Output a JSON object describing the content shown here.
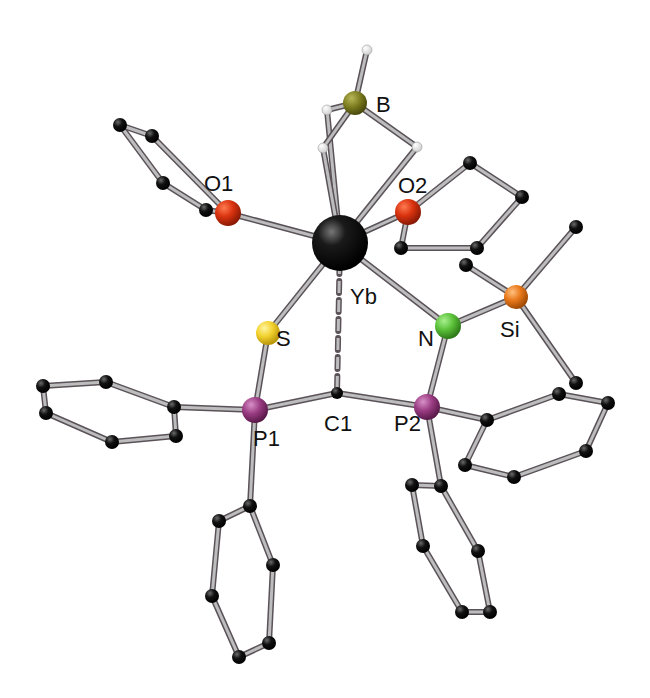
{
  "colors": {
    "background": "#ffffff",
    "bond_light": "#bdbdbd",
    "bond_dark": "#5a5258",
    "carbon": "#0d0d0d",
    "hydrogen": "#f2f2f2",
    "Yb": "#111111",
    "B": "#7a7a1e",
    "O": "#d9330f",
    "S": "#f2d12e",
    "N": "#5cc23a",
    "Si": "#e8781a",
    "P": "#9a3c82"
  },
  "labels": {
    "B": "B",
    "O1": "O1",
    "O2": "O2",
    "Yb": "Yb",
    "S": "S",
    "N": "N",
    "Si": "Si",
    "P1": "P1",
    "C1": "C1",
    "P2": "P2"
  },
  "atoms": [
    {
      "id": "Yb",
      "el": "Yb",
      "x": 340,
      "y": 243,
      "r": 28
    },
    {
      "id": "B",
      "el": "B",
      "x": 355,
      "y": 103,
      "r": 12
    },
    {
      "id": "H1",
      "el": "H",
      "x": 367,
      "y": 50,
      "r": 5
    },
    {
      "id": "H2",
      "el": "H",
      "x": 327,
      "y": 110,
      "r": 5
    },
    {
      "id": "H3",
      "el": "H",
      "x": 323,
      "y": 148,
      "r": 5
    },
    {
      "id": "H4",
      "el": "H",
      "x": 417,
      "y": 147,
      "r": 5
    },
    {
      "id": "O1",
      "el": "O",
      "x": 228,
      "y": 213,
      "r": 13
    },
    {
      "id": "O1C1",
      "el": "C",
      "x": 206,
      "y": 210,
      "r": 7
    },
    {
      "id": "O1C2",
      "el": "C",
      "x": 163,
      "y": 183,
      "r": 7
    },
    {
      "id": "O1C3",
      "el": "C",
      "x": 120,
      "y": 125,
      "r": 7
    },
    {
      "id": "O1C4",
      "el": "C",
      "x": 152,
      "y": 136,
      "r": 7
    },
    {
      "id": "O2",
      "el": "O",
      "x": 408,
      "y": 212,
      "r": 13
    },
    {
      "id": "O2C1",
      "el": "C",
      "x": 401,
      "y": 248,
      "r": 7
    },
    {
      "id": "O2C2",
      "el": "C",
      "x": 477,
      "y": 248,
      "r": 7
    },
    {
      "id": "O2C3",
      "el": "C",
      "x": 522,
      "y": 197,
      "r": 7
    },
    {
      "id": "O2C4",
      "el": "C",
      "x": 470,
      "y": 163,
      "r": 7
    },
    {
      "id": "S",
      "el": "S",
      "x": 268,
      "y": 333,
      "r": 12
    },
    {
      "id": "N",
      "el": "N",
      "x": 448,
      "y": 326,
      "r": 13
    },
    {
      "id": "Si",
      "el": "Si",
      "x": 516,
      "y": 297,
      "r": 12
    },
    {
      "id": "SiMe1",
      "el": "C",
      "x": 576,
      "y": 227,
      "r": 7
    },
    {
      "id": "SiMe2",
      "el": "C",
      "x": 466,
      "y": 265,
      "r": 7
    },
    {
      "id": "SiMe3",
      "el": "C",
      "x": 576,
      "y": 383,
      "r": 7
    },
    {
      "id": "P1",
      "el": "P",
      "x": 255,
      "y": 410,
      "r": 13
    },
    {
      "id": "C1",
      "el": "C",
      "x": 337,
      "y": 393,
      "r": 6
    },
    {
      "id": "P2",
      "el": "P",
      "x": 427,
      "y": 407,
      "r": 13
    },
    {
      "id": "Ph1a",
      "el": "C",
      "x": 174,
      "y": 407,
      "r": 7
    },
    {
      "id": "Ph1b",
      "el": "C",
      "x": 106,
      "y": 382,
      "r": 7
    },
    {
      "id": "Ph1c",
      "el": "C",
      "x": 43,
      "y": 386,
      "r": 7
    },
    {
      "id": "Ph1d",
      "el": "C",
      "x": 46,
      "y": 413,
      "r": 7
    },
    {
      "id": "Ph1e",
      "el": "C",
      "x": 112,
      "y": 442,
      "r": 7
    },
    {
      "id": "Ph1f",
      "el": "C",
      "x": 176,
      "y": 436,
      "r": 7
    },
    {
      "id": "Ph2a",
      "el": "C",
      "x": 250,
      "y": 506,
      "r": 7
    },
    {
      "id": "Ph2b",
      "el": "C",
      "x": 219,
      "y": 521,
      "r": 7
    },
    {
      "id": "Ph2c",
      "el": "C",
      "x": 212,
      "y": 596,
      "r": 7
    },
    {
      "id": "Ph2d",
      "el": "C",
      "x": 239,
      "y": 657,
      "r": 7
    },
    {
      "id": "Ph2e",
      "el": "C",
      "x": 269,
      "y": 643,
      "r": 7
    },
    {
      "id": "Ph2f",
      "el": "C",
      "x": 273,
      "y": 565,
      "r": 7
    },
    {
      "id": "Ph3a",
      "el": "C",
      "x": 487,
      "y": 420,
      "r": 7
    },
    {
      "id": "Ph3b",
      "el": "C",
      "x": 559,
      "y": 394,
      "r": 7
    },
    {
      "id": "Ph3c",
      "el": "C",
      "x": 608,
      "y": 403,
      "r": 7
    },
    {
      "id": "Ph3d",
      "el": "C",
      "x": 586,
      "y": 451,
      "r": 7
    },
    {
      "id": "Ph3e",
      "el": "C",
      "x": 514,
      "y": 477,
      "r": 7
    },
    {
      "id": "Ph3f",
      "el": "C",
      "x": 465,
      "y": 465,
      "r": 7
    },
    {
      "id": "Ph4a",
      "el": "C",
      "x": 441,
      "y": 486,
      "r": 7
    },
    {
      "id": "Ph4b",
      "el": "C",
      "x": 412,
      "y": 485,
      "r": 7
    },
    {
      "id": "Ph4c",
      "el": "C",
      "x": 423,
      "y": 546,
      "r": 7
    },
    {
      "id": "Ph4d",
      "el": "C",
      "x": 462,
      "y": 612,
      "r": 7
    },
    {
      "id": "Ph4e",
      "el": "C",
      "x": 490,
      "y": 612,
      "r": 7
    },
    {
      "id": "Ph4f",
      "el": "C",
      "x": 478,
      "y": 551,
      "r": 7
    }
  ],
  "bonds": [
    [
      "Yb",
      "H2"
    ],
    [
      "Yb",
      "H3"
    ],
    [
      "Yb",
      "H4"
    ],
    [
      "B",
      "H1"
    ],
    [
      "B",
      "H2"
    ],
    [
      "B",
      "H3"
    ],
    [
      "B",
      "H4"
    ],
    [
      "Yb",
      "O1"
    ],
    [
      "O1",
      "O1C1"
    ],
    [
      "O1C1",
      "O1C2"
    ],
    [
      "O1C2",
      "O1C3"
    ],
    [
      "O1C3",
      "O1C4"
    ],
    [
      "O1C4",
      "O1"
    ],
    [
      "Yb",
      "O2"
    ],
    [
      "O2",
      "O2C1"
    ],
    [
      "O2C1",
      "O2C2"
    ],
    [
      "O2C2",
      "O2C3"
    ],
    [
      "O2C3",
      "O2C4"
    ],
    [
      "O2C4",
      "O2"
    ],
    [
      "Yb",
      "S"
    ],
    [
      "Yb",
      "N"
    ],
    [
      "N",
      "Si"
    ],
    [
      "Si",
      "SiMe1"
    ],
    [
      "Si",
      "SiMe2"
    ],
    [
      "Si",
      "SiMe3"
    ],
    [
      "S",
      "P1"
    ],
    [
      "P1",
      "C1"
    ],
    [
      "C1",
      "P2"
    ],
    [
      "P2",
      "N"
    ],
    [
      "P1",
      "Ph1a"
    ],
    [
      "Ph1a",
      "Ph1b"
    ],
    [
      "Ph1b",
      "Ph1c"
    ],
    [
      "Ph1c",
      "Ph1d"
    ],
    [
      "Ph1d",
      "Ph1e"
    ],
    [
      "Ph1e",
      "Ph1f"
    ],
    [
      "Ph1f",
      "Ph1a"
    ],
    [
      "P1",
      "Ph2a"
    ],
    [
      "Ph2a",
      "Ph2b"
    ],
    [
      "Ph2b",
      "Ph2c"
    ],
    [
      "Ph2c",
      "Ph2d"
    ],
    [
      "Ph2d",
      "Ph2e"
    ],
    [
      "Ph2e",
      "Ph2f"
    ],
    [
      "Ph2f",
      "Ph2a"
    ],
    [
      "P2",
      "Ph3a"
    ],
    [
      "Ph3a",
      "Ph3b"
    ],
    [
      "Ph3b",
      "Ph3c"
    ],
    [
      "Ph3c",
      "Ph3d"
    ],
    [
      "Ph3d",
      "Ph3e"
    ],
    [
      "Ph3e",
      "Ph3f"
    ],
    [
      "Ph3f",
      "Ph3a"
    ],
    [
      "P2",
      "Ph4a"
    ],
    [
      "Ph4a",
      "Ph4b"
    ],
    [
      "Ph4b",
      "Ph4c"
    ],
    [
      "Ph4c",
      "Ph4d"
    ],
    [
      "Ph4d",
      "Ph4e"
    ],
    [
      "Ph4e",
      "Ph4f"
    ],
    [
      "Ph4f",
      "Ph4a"
    ]
  ],
  "dashed_bonds": [
    [
      "Yb",
      "C1"
    ]
  ],
  "label_positions": {
    "B": {
      "x": 376,
      "y": 112
    },
    "O1": {
      "x": 204,
      "y": 191
    },
    "O2": {
      "x": 398,
      "y": 193
    },
    "Yb": {
      "x": 350,
      "y": 304
    },
    "S": {
      "x": 276,
      "y": 346
    },
    "N": {
      "x": 418,
      "y": 346
    },
    "Si": {
      "x": 500,
      "y": 337
    },
    "P1": {
      "x": 253,
      "y": 446
    },
    "C1": {
      "x": 324,
      "y": 431
    },
    "P2": {
      "x": 394,
      "y": 431
    }
  }
}
